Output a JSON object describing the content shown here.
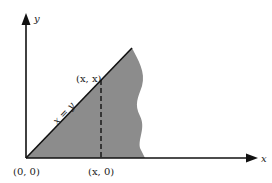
{
  "diagram": {
    "axes": {
      "x_label": "x",
      "y_label": "y"
    },
    "line_label": "x = y",
    "points": {
      "origin": "(0, 0)",
      "on_line": "(x, x)",
      "on_axis": "(x, 0)"
    },
    "colors": {
      "shaded_region": "#8c8c8c",
      "lines": "#111111",
      "background": "#ffffff"
    }
  }
}
